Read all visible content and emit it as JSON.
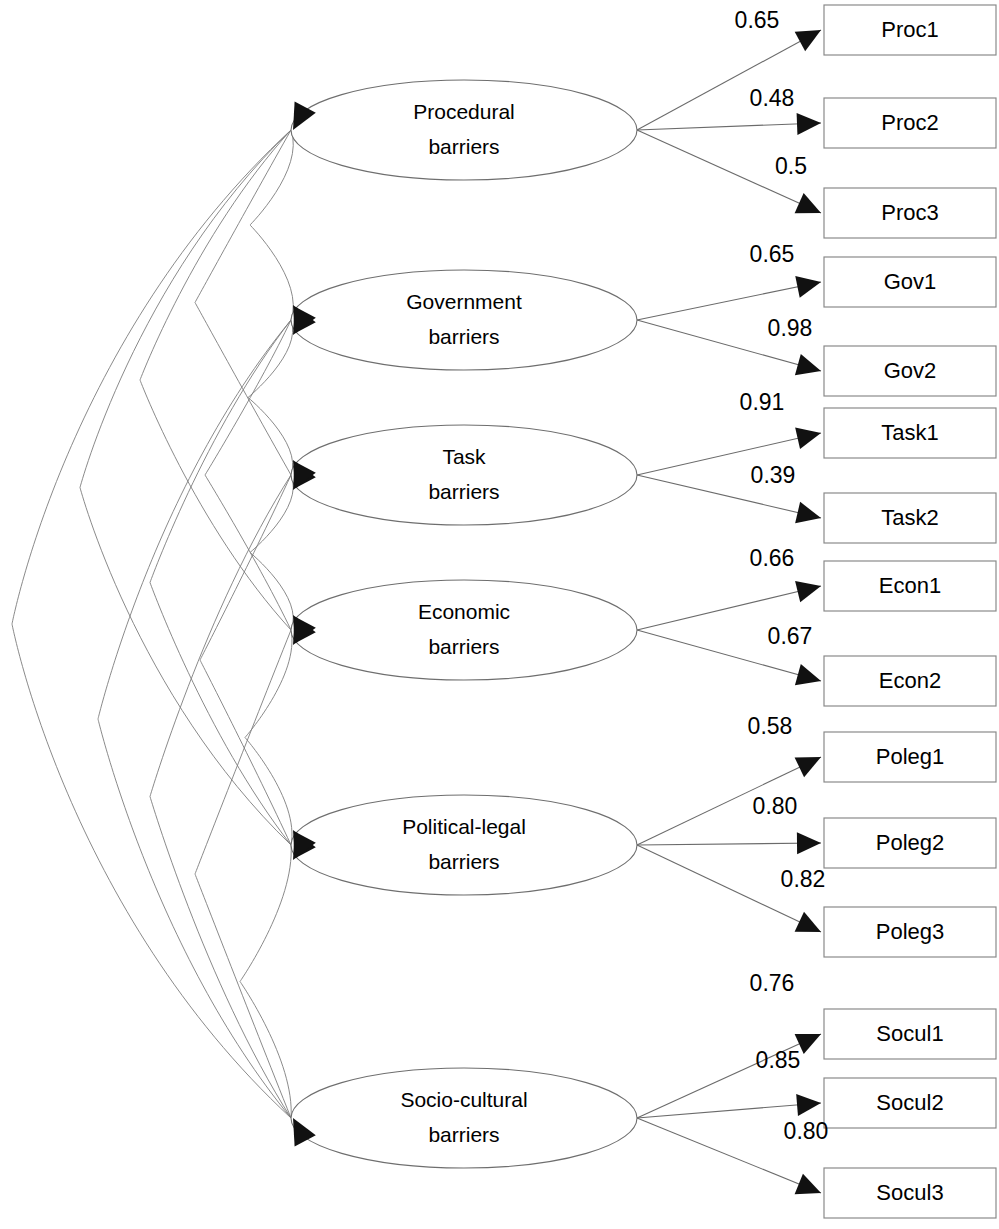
{
  "diagram": {
    "type": "structural-equation-model",
    "title": "",
    "geometry": {
      "width": 999,
      "height": 1229,
      "ellipse_rx": 173,
      "ellipse_ry": 50,
      "ellipse_cx": 464,
      "box_left": 824,
      "box_right": 996,
      "box_height": 50
    },
    "latents": [
      {
        "id": "procedural",
        "line1": "Procedural",
        "line2": "barriers",
        "cy": 130,
        "arrow_dirs": [
          "down"
        ]
      },
      {
        "id": "government",
        "line1": "Government",
        "line2": "barriers",
        "cy": 320,
        "arrow_dirs": [
          "up",
          "down"
        ]
      },
      {
        "id": "task",
        "line1": "Task",
        "line2": "barriers",
        "cy": 475,
        "arrow_dirs": [
          "up",
          "down"
        ]
      },
      {
        "id": "economic",
        "line1": "Economic",
        "line2": "barriers",
        "cy": 630,
        "arrow_dirs": [
          "up",
          "down"
        ]
      },
      {
        "id": "political_legal",
        "line1": "Political-legal",
        "line2": "barriers",
        "cy": 845,
        "arrow_dirs": [
          "up",
          "down"
        ]
      },
      {
        "id": "socio_cultural",
        "line1": "Socio-cultural",
        "line2": "barriers",
        "cy": 1118,
        "arrow_dirs": [
          "up"
        ]
      }
    ],
    "indicators": [
      {
        "id": "proc1",
        "label": "Proc1",
        "latent": "procedural",
        "loading": "0.65",
        "cy": 30,
        "label_x": 757,
        "label_y": 22
      },
      {
        "id": "proc2",
        "label": "Proc2",
        "latent": "procedural",
        "loading": "0.48",
        "cy": 123,
        "label_x": 772,
        "label_y": 100
      },
      {
        "id": "proc3",
        "label": "Proc3",
        "latent": "procedural",
        "loading": "0.5",
        "cy": 213,
        "label_x": 791,
        "label_y": 168
      },
      {
        "id": "gov1",
        "label": "Gov1",
        "latent": "government",
        "loading": "0.65",
        "cy": 282,
        "label_x": 772,
        "label_y": 256
      },
      {
        "id": "gov2",
        "label": "Gov2",
        "latent": "government",
        "loading": "0.98",
        "cy": 371,
        "label_x": 790,
        "label_y": 330
      },
      {
        "id": "task1",
        "label": "Task1",
        "latent": "task",
        "loading": "0.91",
        "cy": 433,
        "label_x": 762,
        "label_y": 404
      },
      {
        "id": "task2",
        "label": "Task2",
        "latent": "task",
        "loading": "0.39",
        "cy": 518,
        "label_x": 773,
        "label_y": 477
      },
      {
        "id": "econ1",
        "label": "Econ1",
        "latent": "economic",
        "loading": "0.66",
        "cy": 586,
        "label_x": 772,
        "label_y": 560
      },
      {
        "id": "econ2",
        "label": "Econ2",
        "latent": "economic",
        "loading": "0.67",
        "cy": 681,
        "label_x": 790,
        "label_y": 638
      },
      {
        "id": "poleg1",
        "label": "Poleg1",
        "latent": "political_legal",
        "loading": "0.58",
        "cy": 757,
        "label_x": 770,
        "label_y": 728
      },
      {
        "id": "poleg2",
        "label": "Poleg2",
        "latent": "political_legal",
        "loading": "0.80",
        "cy": 843,
        "label_x": 775,
        "label_y": 808
      },
      {
        "id": "poleg3",
        "label": "Poleg3",
        "latent": "political_legal",
        "loading": "0.82",
        "cy": 932,
        "label_x": 803,
        "label_y": 881
      },
      {
        "id": "socul1",
        "label": "Socul1",
        "latent": "socio_cultural",
        "loading": "0.76",
        "cy": 1034,
        "label_x": 772,
        "label_y": 985
      },
      {
        "id": "socul2",
        "label": "Socul2",
        "latent": "socio_cultural",
        "loading": "0.85",
        "cy": 1103,
        "label_x": 778,
        "label_y": 1062
      },
      {
        "id": "socul3",
        "label": "Socul3",
        "latent": "socio_cultural",
        "loading": "0.80",
        "cy": 1193,
        "label_x": 806,
        "label_y": 1133
      }
    ],
    "correlations": [
      {
        "from": "procedural",
        "to": "government",
        "left_extent": 250
      },
      {
        "from": "procedural",
        "to": "task",
        "left_extent": 195
      },
      {
        "from": "procedural",
        "to": "economic",
        "left_extent": 140
      },
      {
        "from": "procedural",
        "to": "political_legal",
        "left_extent": 80
      },
      {
        "from": "procedural",
        "to": "socio_cultural",
        "left_extent": 12
      },
      {
        "from": "government",
        "to": "task",
        "left_extent": 248
      },
      {
        "from": "government",
        "to": "economic",
        "left_extent": 205
      },
      {
        "from": "government",
        "to": "political_legal",
        "left_extent": 150
      },
      {
        "from": "government",
        "to": "socio_cultural",
        "left_extent": 98
      },
      {
        "from": "task",
        "to": "economic",
        "left_extent": 250
      },
      {
        "from": "task",
        "to": "political_legal",
        "left_extent": 200
      },
      {
        "from": "task",
        "to": "socio_cultural",
        "left_extent": 150
      },
      {
        "from": "economic",
        "to": "political_legal",
        "left_extent": 245
      },
      {
        "from": "economic",
        "to": "socio_cultural",
        "left_extent": 195
      },
      {
        "from": "political_legal",
        "to": "socio_cultural",
        "left_extent": 240
      }
    ]
  }
}
